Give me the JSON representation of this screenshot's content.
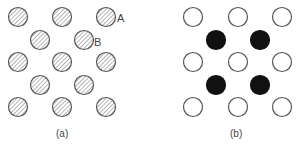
{
  "panel_a": {
    "caption": "(a)",
    "label_A": "A",
    "label_B": "B",
    "atom_style": "hatched",
    "atoms": [
      {
        "x": 18,
        "y": 17
      },
      {
        "x": 62,
        "y": 17
      },
      {
        "x": 106,
        "y": 17
      },
      {
        "x": 40,
        "y": 40
      },
      {
        "x": 84,
        "y": 40
      },
      {
        "x": 18,
        "y": 62
      },
      {
        "x": 62,
        "y": 62
      },
      {
        "x": 106,
        "y": 62
      },
      {
        "x": 40,
        "y": 85
      },
      {
        "x": 84,
        "y": 85
      },
      {
        "x": 18,
        "y": 107
      },
      {
        "x": 62,
        "y": 107
      },
      {
        "x": 106,
        "y": 107
      }
    ]
  },
  "panel_b": {
    "caption": "(b)",
    "open_atoms": [
      {
        "x": 193,
        "y": 17
      },
      {
        "x": 238,
        "y": 17
      },
      {
        "x": 282,
        "y": 17
      },
      {
        "x": 193,
        "y": 62
      },
      {
        "x": 238,
        "y": 62
      },
      {
        "x": 282,
        "y": 62
      },
      {
        "x": 193,
        "y": 107
      },
      {
        "x": 238,
        "y": 107
      },
      {
        "x": 282,
        "y": 107
      }
    ],
    "filled_atoms": [
      {
        "x": 216,
        "y": 40
      },
      {
        "x": 260,
        "y": 40
      },
      {
        "x": 216,
        "y": 85
      },
      {
        "x": 260,
        "y": 85
      }
    ]
  },
  "colors": {
    "stroke": "#555555",
    "filled": "#111111",
    "hatch": "#777777"
  }
}
